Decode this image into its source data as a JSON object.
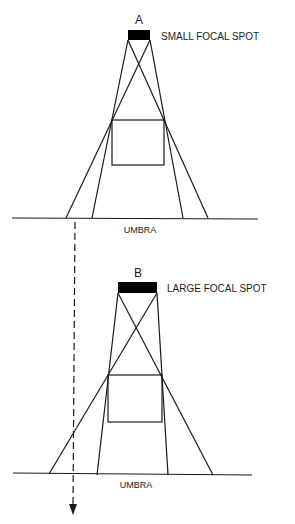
{
  "diagram": {
    "panel_a": {
      "letter": "A",
      "focal_label": "SMALL FOCAL SPOT",
      "plane_label": "UMBRA"
    },
    "panel_b": {
      "letter": "B",
      "focal_label": "LARGE FOCAL SPOT",
      "plane_label": "UMBRA"
    },
    "colors": {
      "line": "#1a1a1a",
      "focal_spot": "#000000",
      "background": "#ffffff"
    }
  }
}
